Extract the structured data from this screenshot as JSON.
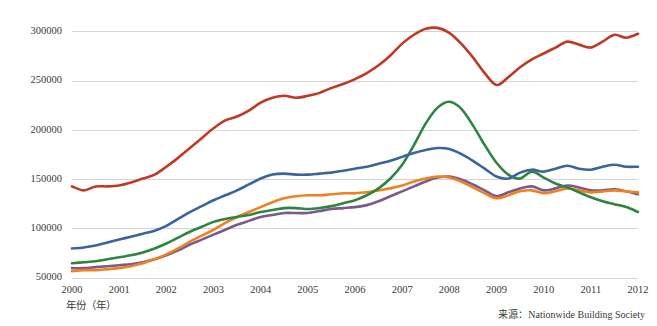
{
  "figure": {
    "xlabel": "年份（年）",
    "source_note": "来源：Nationwide Building Society"
  },
  "chart_data": {
    "type": "line",
    "title": "",
    "subtitle": "",
    "xlabel": "年份（年）",
    "ylabel": "",
    "grid": true,
    "legend_position": "none",
    "xlim": [
      2000,
      2012
    ],
    "ylim": [
      50000,
      312000
    ],
    "ytick_labels": [
      "300000",
      "250000",
      "200000",
      "150000",
      "100000",
      "50000"
    ],
    "yticks": [
      300000,
      250000,
      200000,
      150000,
      100000,
      50000
    ],
    "xtick_labels": [
      "2000",
      "2001",
      "2002",
      "2003",
      "2004",
      "2005",
      "2006",
      "2007",
      "2008",
      "2009",
      "2010",
      "2011",
      "2012"
    ],
    "xticks": [
      2000,
      2001,
      2002,
      2003,
      2004,
      2005,
      2006,
      2007,
      2008,
      2009,
      2010,
      2011,
      2012
    ],
    "annotations": [
      "来源：Nationwide Building Society"
    ],
    "x": [
      2000,
      2000.25,
      2000.5,
      2000.75,
      2001,
      2001.25,
      2001.5,
      2001.75,
      2002,
      2002.25,
      2002.5,
      2002.75,
      2003,
      2003.25,
      2003.5,
      2003.75,
      2004,
      2004.25,
      2004.5,
      2004.75,
      2005,
      2005.25,
      2005.5,
      2005.75,
      2006,
      2006.25,
      2006.5,
      2006.75,
      2007,
      2007.25,
      2007.5,
      2007.75,
      2008,
      2008.25,
      2008.5,
      2008.75,
      2009,
      2009.25,
      2009.5,
      2009.75,
      2010,
      2010.25,
      2010.5,
      2010.75,
      2011,
      2011.25,
      2011.5,
      2011.75,
      2012
    ],
    "series": [
      {
        "name": "series-red",
        "color": "#BE3A22",
        "values": [
          143000,
          139000,
          143000,
          143000,
          144000,
          147000,
          151000,
          155000,
          163000,
          172000,
          182000,
          192000,
          202000,
          210000,
          214000,
          220000,
          228000,
          233000,
          235000,
          233000,
          235000,
          238000,
          243000,
          247000,
          252000,
          258000,
          266000,
          276000,
          288000,
          297000,
          303000,
          304000,
          299000,
          288000,
          274000,
          258000,
          246000,
          254000,
          264000,
          272000,
          278000,
          284000,
          290000,
          287000,
          284000,
          290000,
          297000,
          294000,
          298000
        ]
      },
      {
        "name": "series-blue",
        "color": "#3A649E",
        "values": [
          80000,
          81000,
          83000,
          86000,
          89000,
          92000,
          95000,
          98000,
          103000,
          110000,
          117000,
          123000,
          129000,
          134000,
          139000,
          145000,
          151000,
          155000,
          156000,
          155000,
          155000,
          156000,
          157000,
          159000,
          161000,
          163000,
          166000,
          169000,
          173000,
          177000,
          180000,
          182000,
          181000,
          176000,
          169000,
          161000,
          153000,
          151000,
          157000,
          160000,
          158000,
          161000,
          164000,
          161000,
          160000,
          163000,
          165000,
          163000,
          163000
        ]
      },
      {
        "name": "series-green",
        "color": "#2E8540",
        "values": [
          65000,
          66000,
          67000,
          69000,
          71000,
          73000,
          76000,
          80000,
          85000,
          91000,
          97000,
          102000,
          107000,
          110000,
          112000,
          114000,
          117000,
          119000,
          121000,
          121000,
          120000,
          121000,
          123000,
          126000,
          129000,
          134000,
          141000,
          151000,
          165000,
          185000,
          207000,
          223000,
          229000,
          222000,
          205000,
          185000,
          167000,
          155000,
          151000,
          158000,
          152000,
          146000,
          142000,
          137000,
          132000,
          128000,
          125000,
          122000,
          117000
        ]
      },
      {
        "name": "series-orange",
        "color": "#ED8222",
        "values": [
          57000,
          58000,
          58000,
          59000,
          60000,
          62000,
          65000,
          69000,
          74000,
          80000,
          87000,
          93000,
          99000,
          106000,
          112000,
          117000,
          122000,
          127000,
          131000,
          133000,
          134000,
          134000,
          135000,
          136000,
          136000,
          137000,
          139000,
          141000,
          144000,
          148000,
          151000,
          153000,
          152000,
          148000,
          142000,
          136000,
          131000,
          134000,
          138000,
          139000,
          136000,
          138000,
          141000,
          139000,
          137000,
          138000,
          139000,
          138000,
          137000
        ]
      },
      {
        "name": "series-purple",
        "color": "#7A5A8A"
      }
    ]
  },
  "series_purple_values": [
    60000,
    60000,
    61000,
    62000,
    63000,
    64000,
    66000,
    69000,
    73000,
    78000,
    84000,
    89000,
    94000,
    99000,
    104000,
    108000,
    112000,
    114000,
    116000,
    116000,
    116000,
    118000,
    120000,
    121000,
    122000,
    124000,
    128000,
    133000,
    138000,
    143000,
    148000,
    152000,
    153000,
    150000,
    145000,
    139000,
    133000,
    137000,
    141000,
    143000,
    139000,
    141000,
    144000,
    142000,
    139000,
    139000,
    140000,
    138000,
    135000
  ]
}
